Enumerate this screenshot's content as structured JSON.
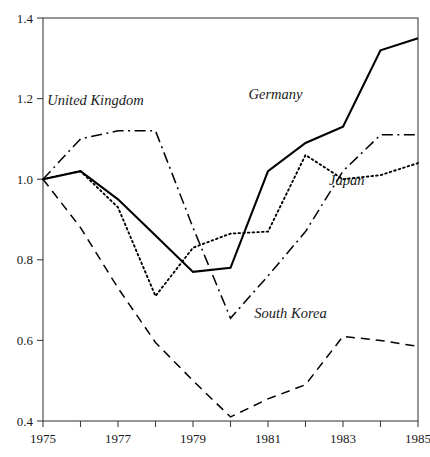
{
  "chart_data": {
    "type": "line",
    "title": "",
    "subtitle": "",
    "xlabel": "",
    "ylabel": "",
    "xlim": [
      1975,
      1985
    ],
    "ylim": [
      0.4,
      1.4
    ],
    "grid": false,
    "legend_position": "inline-annotations",
    "x": [
      1975,
      1976,
      1977,
      1978,
      1979,
      1980,
      1981,
      1982,
      1983,
      1984,
      1985
    ],
    "xticks": [
      1975,
      1976,
      1977,
      1978,
      1979,
      1980,
      1981,
      1982,
      1983,
      1984,
      1985
    ],
    "xticklabels": [
      "1975",
      "",
      "1977",
      "",
      "1979",
      "",
      "1981",
      "",
      "1983",
      "",
      "1985"
    ],
    "yticks": [
      0.4,
      0.6,
      0.8,
      1.0,
      1.2,
      1.4
    ],
    "yticklabels": [
      "0.4",
      "0.6",
      "0.8",
      "1.0",
      "1.2",
      "1.4"
    ],
    "series": [
      {
        "name": "Germany",
        "style": "solid",
        "color": "#000000",
        "label_x": 1981.2,
        "label_y": 1.2,
        "values": [
          1.0,
          1.02,
          0.95,
          0.86,
          0.77,
          0.78,
          1.02,
          1.09,
          1.13,
          1.32,
          1.35
        ]
      },
      {
        "name": "United Kingdom",
        "style": "dash-dot",
        "color": "#000000",
        "label_x": 1976.4,
        "label_y": 1.185,
        "values": [
          1.0,
          1.1,
          1.12,
          1.12,
          0.88,
          0.655,
          0.76,
          0.87,
          1.02,
          1.11,
          1.11
        ]
      },
      {
        "name": "Japan",
        "style": "dotted",
        "color": "#000000",
        "label_x": 1983.1,
        "label_y": 0.985,
        "values": [
          1.0,
          1.02,
          0.93,
          0.71,
          0.83,
          0.865,
          0.87,
          1.06,
          1.0,
          1.01,
          1.04
        ]
      },
      {
        "name": "South Korea",
        "style": "dashed",
        "color": "#000000",
        "label_x": 1981.6,
        "label_y": 0.655,
        "values": [
          1.0,
          0.88,
          0.73,
          0.595,
          0.5,
          0.41,
          0.455,
          0.49,
          0.61,
          0.6,
          0.585
        ]
      }
    ]
  },
  "axes": {
    "frame_color": "#404040",
    "tick_color": "#404040",
    "plot_left_px": 43,
    "plot_right_px": 418,
    "plot_top_px": 18,
    "plot_bottom_px": 421
  }
}
